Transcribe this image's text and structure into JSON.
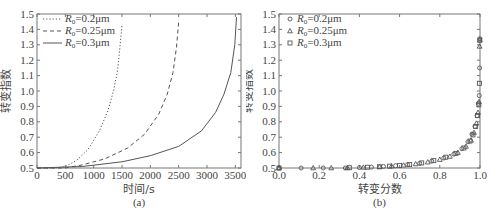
{
  "chart_data": [
    {
      "type": "line",
      "panel_label": "(a)",
      "title": "",
      "xlabel": "时间/s",
      "ylabel": "转变指数",
      "xlim": [
        0,
        3600
      ],
      "ylim": [
        0.5,
        1.5
      ],
      "xticks": [
        "0",
        "500",
        "1000",
        "1500",
        "2000",
        "2500",
        "3000",
        "3500"
      ],
      "yticks": [
        "0.5",
        "0.6",
        "0.7",
        "0.8",
        "0.9",
        "1.0",
        "1.1",
        "1.2",
        "1.3",
        "1.4",
        "1.5"
      ],
      "grid": false,
      "legend_position": "upper left",
      "series": [
        {
          "name": "R0=0.2μm",
          "legend_label": "=0.2μm",
          "style": "dotted",
          "x": [
            0,
            300,
            500,
            700,
            900,
            1100,
            1250,
            1350,
            1420,
            1460,
            1500
          ],
          "y": [
            0.5,
            0.5,
            0.51,
            0.55,
            0.62,
            0.74,
            0.87,
            1.0,
            1.13,
            1.27,
            1.43
          ]
        },
        {
          "name": "R0=0.25μm",
          "legend_label": "=0.25μm",
          "style": "dashed",
          "x": [
            0,
            500,
            800,
            1200,
            1600,
            1900,
            2150,
            2300,
            2400,
            2460,
            2500
          ],
          "y": [
            0.5,
            0.5,
            0.52,
            0.56,
            0.63,
            0.72,
            0.85,
            0.98,
            1.12,
            1.28,
            1.45
          ]
        },
        {
          "name": "R0=0.3μm",
          "legend_label": "=0.3μm",
          "style": "solid",
          "x": [
            0,
            800,
            1500,
            2000,
            2500,
            2900,
            3150,
            3300,
            3420,
            3490,
            3520
          ],
          "y": [
            0.5,
            0.51,
            0.54,
            0.58,
            0.64,
            0.74,
            0.86,
            0.98,
            1.12,
            1.3,
            1.48
          ]
        }
      ]
    },
    {
      "type": "scatter",
      "panel_label": "(b)",
      "title": "",
      "xlabel": "转变分数",
      "ylabel": "转变指数",
      "xlim": [
        0.0,
        1.0
      ],
      "ylim": [
        0.5,
        1.5
      ],
      "xticks": [
        "0.0",
        "0.2",
        "0.4",
        "0.6",
        "0.8",
        "1.0"
      ],
      "yticks": [
        "0.5",
        "0.6",
        "0.7",
        "0.8",
        "0.9",
        "1.0",
        "1.1",
        "1.2",
        "1.3",
        "1.4",
        "1.5"
      ],
      "grid": false,
      "legend_position": "upper left",
      "series": [
        {
          "name": "R0=0.2μm",
          "legend_label": "=0.2μm",
          "marker": "circle",
          "x": [
            0.0,
            0.11,
            0.22,
            0.33,
            0.4,
            0.46,
            0.52,
            0.58,
            0.64,
            0.7,
            0.76,
            0.82,
            0.87,
            0.91,
            0.94,
            0.96,
            0.975,
            0.985,
            0.992,
            0.996,
            0.998,
            0.999
          ],
          "y": [
            0.5,
            0.5,
            0.5,
            0.5,
            0.503,
            0.506,
            0.51,
            0.515,
            0.522,
            0.53,
            0.545,
            0.565,
            0.59,
            0.625,
            0.67,
            0.72,
            0.77,
            0.84,
            0.92,
            0.97,
            1.15,
            1.34
          ]
        },
        {
          "name": "R0=0.25μm",
          "legend_label": "=0.25μm",
          "marker": "triangle",
          "x": [
            0.0,
            0.17,
            0.26,
            0.34,
            0.42,
            0.5,
            0.56,
            0.62,
            0.68,
            0.74,
            0.8,
            0.85,
            0.89,
            0.93,
            0.955,
            0.97,
            0.982,
            0.99,
            0.995,
            0.998,
            0.999
          ],
          "y": [
            0.5,
            0.5,
            0.5,
            0.501,
            0.504,
            0.508,
            0.512,
            0.518,
            0.526,
            0.538,
            0.555,
            0.575,
            0.6,
            0.64,
            0.68,
            0.73,
            0.79,
            0.86,
            0.93,
            1.29,
            1.33
          ]
        },
        {
          "name": "R0=0.3μm",
          "legend_label": "=0.3μm",
          "marker": "square",
          "x": [
            0.0,
            0.35,
            0.44,
            0.5,
            0.55,
            0.6,
            0.65,
            0.71,
            0.77,
            0.83,
            0.88,
            0.92,
            0.95,
            0.965,
            0.978,
            0.988,
            0.994,
            0.997,
            0.999
          ],
          "y": [
            0.5,
            0.502,
            0.505,
            0.508,
            0.512,
            0.516,
            0.522,
            0.533,
            0.548,
            0.57,
            0.595,
            0.63,
            0.675,
            0.715,
            0.77,
            0.84,
            0.91,
            1.05,
            1.33
          ]
        }
      ]
    }
  ]
}
